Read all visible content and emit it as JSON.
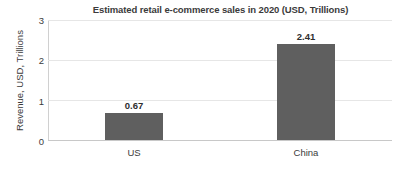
{
  "chart_data": {
    "type": "bar",
    "title": "Estimated retail e-commerce sales in 2020 (USD, Trillions)",
    "xlabel": "",
    "ylabel": "Revenue, USD, Trillions",
    "categories": [
      "US",
      "China"
    ],
    "values": [
      0.67,
      2.41
    ],
    "data_labels": [
      "0.67",
      "2.41"
    ],
    "ylim": [
      0,
      3
    ],
    "yticks": [
      0,
      1,
      2,
      3
    ],
    "ytick_labels": [
      "0",
      "1",
      "2",
      "3"
    ],
    "grid": true,
    "grid_axis": "y",
    "legend": false,
    "legend_position": "none",
    "series": [
      {
        "name": "Revenue",
        "values": [
          0.67,
          2.41
        ],
        "color": "#5f5f5f"
      }
    ]
  },
  "colors": {
    "bar_fill": "#5f5f5f",
    "gridline": "#e6e6e6",
    "axis_line": "#c8c8c8",
    "title_text": "#3b3b3b",
    "label_text": "#2e2e2e",
    "background": "#ffffff"
  }
}
